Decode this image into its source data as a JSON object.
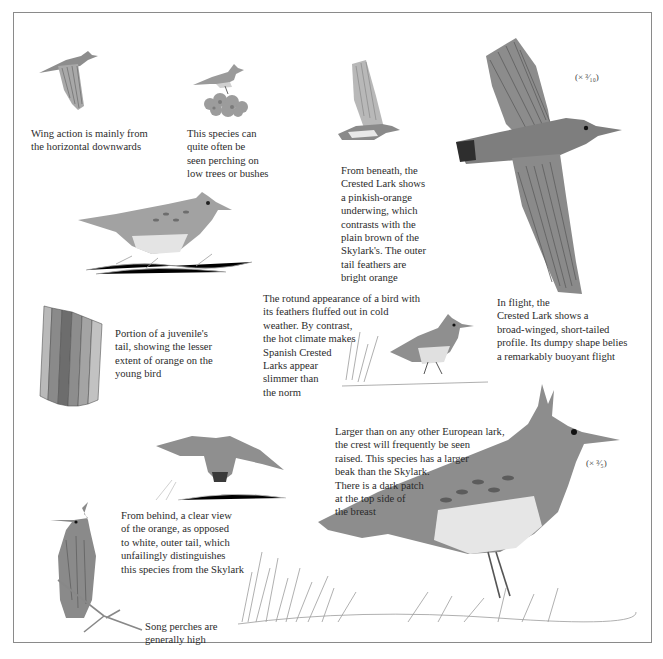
{
  "page": {
    "subject": "Crested Lark",
    "frame_color": "#8a8a8a",
    "ink_color": "#2b2b2b"
  },
  "captions": {
    "wing_action": "Wing action is mainly from\nthe horizontal downwards",
    "perching": "This species can\nquite often be\nseen perching on\nlow trees or bushes",
    "beneath": "From beneath, the\nCrested Lark shows\na pinkish-orange\nunderwing, which\ncontrasts with the\nplain brown of the\nSkylark's. The outer\ntail feathers are\nbright orange",
    "juvenile_tail": "Portion of a juvenile's\ntail, showing the lesser\nextent of orange on the\nyoung bird",
    "rotund": "The rotund appearance of a bird with\nits feathers fluffed out in cold\nweather. By contrast,\nthe hot climate makes\nSpanish Crested\nLarks appear\nslimmer than\nthe norm",
    "in_flight": "In flight, the\nCrested Lark shows a\nbroad-winged, short-tailed\nprofile. Its dumpy shape belies\na remarkably buoyant flight",
    "crest": "Larger than on any other European lark,\nthe crest will frequently be seen\nraised. This species has a larger\nbeak than the Skylark.\nThere is a dark patch\nat the top side of\nthe breast",
    "from_behind": "From behind, a clear view\nof the orange, as opposed\nto white, outer tail, which\nunfailingly distinguishes\nthis species from the Skylark",
    "song_perches": "Song perches are\ngenerally high"
  },
  "scales": {
    "flight_bird": "(× ³⁄₁₀)",
    "standing_bird": "(× ³⁄₅)"
  },
  "illustrations": [
    {
      "id": "flying-side",
      "desc": "lark in flight, wing raised"
    },
    {
      "id": "perched-on-bush",
      "desc": "lark perched on low bush"
    },
    {
      "id": "flying-underside",
      "desc": "lark seen from beneath"
    },
    {
      "id": "large-flight",
      "desc": "large lark in flight from above"
    },
    {
      "id": "standing-side",
      "desc": "lark standing on ground"
    },
    {
      "id": "juvenile-tail",
      "desc": "juvenile tail feathers"
    },
    {
      "id": "fluffed-bird",
      "desc": "rotund lark in grass"
    },
    {
      "id": "flying-behind",
      "desc": "lark flying seen from behind"
    },
    {
      "id": "perched-behind",
      "desc": "lark on branch from behind"
    },
    {
      "id": "large-standing",
      "desc": "large crested lark standing in grass"
    }
  ]
}
